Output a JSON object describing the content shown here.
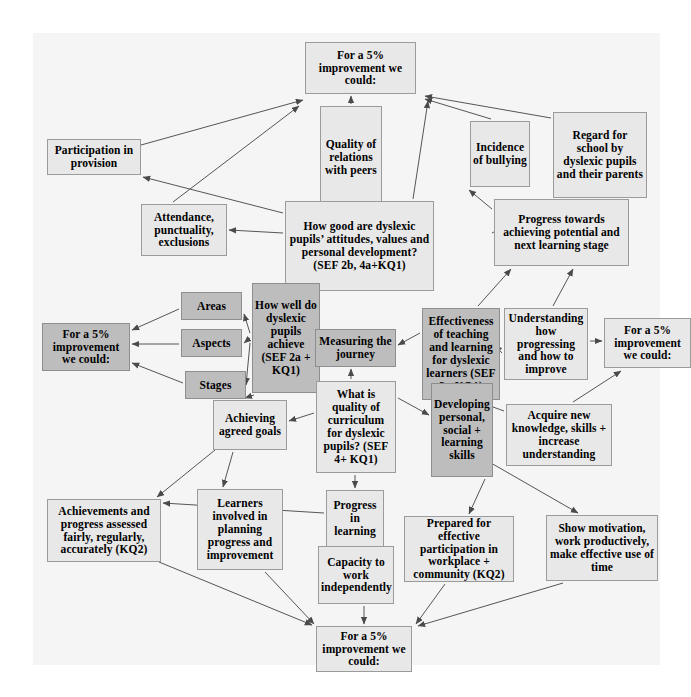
{
  "diagram": {
    "canvas": {
      "background": "#f5f5f5",
      "width": 627,
      "height": 632
    },
    "colors": {
      "node_light": "#e8e8e8",
      "node_dark": "#bdbdbd",
      "node_border": "#9b9b9b",
      "edge": "#555555",
      "text": "#000000"
    },
    "nodes": [
      {
        "id": "improve_top",
        "label": "For a 5% improvement we could:",
        "shade": "light",
        "x": 272,
        "y": 9,
        "w": 111,
        "h": 52,
        "fs": 11.5
      },
      {
        "id": "participation",
        "label": "Participation in provision",
        "shade": "light",
        "x": 14,
        "y": 106,
        "w": 94,
        "h": 36,
        "fs": 11.5
      },
      {
        "id": "quality_rel",
        "label": "Quality of relations with peers",
        "shade": "light",
        "x": 287,
        "y": 73,
        "w": 62,
        "h": 103,
        "fs": 11.5
      },
      {
        "id": "bullying",
        "label": "Incidence of bullying",
        "shade": "light",
        "x": 437,
        "y": 88,
        "w": 60,
        "h": 66,
        "fs": 11.5
      },
      {
        "id": "regard",
        "label": "Regard for school by dyslexic pupils and their parents",
        "shade": "light",
        "x": 520,
        "y": 79,
        "w": 94,
        "h": 86,
        "fs": 11.5
      },
      {
        "id": "attendance",
        "label": "Attendance, punctuality, exclusions",
        "shade": "light",
        "x": 108,
        "y": 171,
        "w": 86,
        "h": 52,
        "fs": 11.5
      },
      {
        "id": "attitudes",
        "label": "How good are dyslexic pupils’ attitudes, values and personal development? (SEF 2b, 4a+KQ1)",
        "shade": "light",
        "x": 252,
        "y": 168,
        "w": 149,
        "h": 90,
        "fs": 11.5
      },
      {
        "id": "progress_towards",
        "label": "Progress towards achieving potential and next learning stage",
        "shade": "light",
        "x": 461,
        "y": 166,
        "w": 135,
        "h": 67,
        "fs": 11.5
      },
      {
        "id": "areas",
        "label": "Areas",
        "shade": "dark",
        "x": 148,
        "y": 259,
        "w": 61,
        "h": 28,
        "fs": 11.5
      },
      {
        "id": "aspects",
        "label": "Aspects",
        "shade": "dark",
        "x": 148,
        "y": 296,
        "w": 61,
        "h": 28,
        "fs": 11.5
      },
      {
        "id": "stages",
        "label": "Stages",
        "shade": "dark",
        "x": 152,
        "y": 338,
        "w": 61,
        "h": 28,
        "fs": 11.5
      },
      {
        "id": "howwell",
        "label": "How well do dyslexic pupils achieve (SEF 2a + KQ1)",
        "shade": "dark",
        "x": 219,
        "y": 250,
        "w": 68,
        "h": 110,
        "fs": 11.5
      },
      {
        "id": "improve_left",
        "label": "For a 5% improvement we could:",
        "shade": "dark",
        "x": 9,
        "y": 290,
        "w": 88,
        "h": 48,
        "fs": 11.5
      },
      {
        "id": "measuring",
        "label": "Measuring the journey",
        "shade": "dark",
        "x": 282,
        "y": 296,
        "w": 81,
        "h": 38,
        "fs": 11.5
      },
      {
        "id": "effectiveness",
        "label": "Effectiveness of teaching and learning for dyslexic learners (SEF 3 +KQ1)",
        "shade": "dark",
        "x": 389,
        "y": 275,
        "w": 78,
        "h": 92,
        "fs": 11.5
      },
      {
        "id": "understanding",
        "label": "Understanding how progressing and how to improve",
        "shade": "light",
        "x": 471,
        "y": 275,
        "w": 84,
        "h": 72,
        "fs": 11.5
      },
      {
        "id": "improve_right",
        "label": "For a 5% improvement we could:",
        "shade": "light",
        "x": 571,
        "y": 285,
        "w": 87,
        "h": 50,
        "fs": 11.5
      },
      {
        "id": "curriculum",
        "label": "What is quality of curriculum for dyslexic pupils? (SEF 4+ KQ1)",
        "shade": "light",
        "x": 283,
        "y": 348,
        "w": 80,
        "h": 92,
        "fs": 11.5
      },
      {
        "id": "developing",
        "label": "Developing personal, social + learning skills",
        "shade": "dark",
        "x": 398,
        "y": 350,
        "w": 62,
        "h": 94,
        "fs": 11.5
      },
      {
        "id": "acquire",
        "label": "Acquire new knowledge, skills + increase understanding",
        "shade": "light",
        "x": 473,
        "y": 371,
        "w": 106,
        "h": 62,
        "fs": 11.5
      },
      {
        "id": "achieving",
        "label": "Achieving agreed goals",
        "shade": "light",
        "x": 180,
        "y": 367,
        "w": 74,
        "h": 50,
        "fs": 11.5
      },
      {
        "id": "achievements",
        "label": "Achievements and progress assessed fairly, regularly, accurately (KQ2)",
        "shade": "light",
        "x": 14,
        "y": 466,
        "w": 114,
        "h": 63,
        "fs": 11.5
      },
      {
        "id": "learners",
        "label": "Learners involved in planning progress and improvement",
        "shade": "light",
        "x": 164,
        "y": 456,
        "w": 86,
        "h": 81,
        "fs": 11.5
      },
      {
        "id": "progress_learn",
        "label": "Progress in learning",
        "shade": "light",
        "x": 293,
        "y": 457,
        "w": 58,
        "h": 57,
        "fs": 11.5
      },
      {
        "id": "capacity",
        "label": "Capacity to work independently",
        "shade": "light",
        "x": 285,
        "y": 513,
        "w": 76,
        "h": 58,
        "fs": 11.5
      },
      {
        "id": "prepared",
        "label": "Prepared for effective participation in workplace + community (KQ2)",
        "shade": "light",
        "x": 371,
        "y": 483,
        "w": 110,
        "h": 66,
        "fs": 11.5
      },
      {
        "id": "motivation",
        "label": "Show motivation, work productively, make effective use of time",
        "shade": "light",
        "x": 513,
        "y": 482,
        "w": 112,
        "h": 66,
        "fs": 11.5
      },
      {
        "id": "improve_bottom",
        "label": "For a 5% improvement we could:",
        "shade": "light",
        "x": 283,
        "y": 593,
        "w": 96,
        "h": 46,
        "fs": 11.5
      }
    ],
    "edges": [
      {
        "from": "participation",
        "to": "improve_top",
        "x1": 108,
        "y1": 112,
        "x2": 270,
        "y2": 67
      },
      {
        "from": "attendance",
        "to": "improve_top",
        "x1": 140,
        "y1": 169,
        "x2": 266,
        "y2": 73
      },
      {
        "from": "attitudes",
        "to": "participation",
        "x1": 250,
        "y1": 180,
        "x2": 110,
        "y2": 144
      },
      {
        "from": "attitudes",
        "to": "attendance",
        "x1": 250,
        "y1": 200,
        "x2": 196,
        "y2": 197
      },
      {
        "from": "quality_rel",
        "to": "improve_top",
        "x1": 318,
        "y1": 71,
        "x2": 318,
        "y2": 63
      },
      {
        "from": "attitudes",
        "to": "quality_rel",
        "x1": 318,
        "y1": 166,
        "x2": 318,
        "y2": 178
      },
      {
        "from": "attitudes",
        "to": "improve_top",
        "x1": 380,
        "y1": 166,
        "x2": 395,
        "y2": 68
      },
      {
        "from": "bullying",
        "to": "improve_top",
        "x1": 458,
        "y1": 86,
        "x2": 392,
        "y2": 66
      },
      {
        "from": "regard",
        "to": "improve_top",
        "x1": 518,
        "y1": 85,
        "x2": 392,
        "y2": 63
      },
      {
        "from": "progress_towards",
        "to": "bullying",
        "x1": 459,
        "y1": 176,
        "x2": 436,
        "y2": 157
      },
      {
        "from": "progress_towards",
        "to": "regard",
        "x1": 459,
        "y1": 200,
        "x2": 518,
        "y2": 168
      },
      {
        "from": "areas",
        "to": "improve_left",
        "x1": 146,
        "y1": 276,
        "x2": 99,
        "y2": 297
      },
      {
        "from": "aspects",
        "to": "improve_left",
        "x1": 146,
        "y1": 311,
        "x2": 99,
        "y2": 311
      },
      {
        "from": "stages",
        "to": "improve_left",
        "x1": 150,
        "y1": 350,
        "x2": 99,
        "y2": 330
      },
      {
        "from": "howwell",
        "to": "areas",
        "x1": 217,
        "y1": 300,
        "x2": 211,
        "y2": 281
      },
      {
        "from": "howwell",
        "to": "aspects",
        "x1": 217,
        "y1": 305,
        "x2": 211,
        "y2": 310
      },
      {
        "from": "howwell",
        "to": "stages",
        "x1": 217,
        "y1": 310,
        "x2": 213,
        "y2": 352
      },
      {
        "from": "measuring",
        "to": "howwell",
        "x1": 280,
        "y1": 315,
        "x2": 289,
        "y2": 315
      },
      {
        "from": "curriculum",
        "to": "measuring",
        "x1": 318,
        "y1": 346,
        "x2": 318,
        "y2": 336
      },
      {
        "from": "effectiveness",
        "to": "progress_towards",
        "x1": 445,
        "y1": 273,
        "x2": 478,
        "y2": 236
      },
      {
        "from": "effectiveness",
        "to": "measuring",
        "x1": 387,
        "y1": 300,
        "x2": 365,
        "y2": 312
      },
      {
        "from": "understanding",
        "to": "progress_towards",
        "x1": 520,
        "y1": 273,
        "x2": 540,
        "y2": 236
      },
      {
        "from": "understanding",
        "to": "improve_right",
        "x1": 557,
        "y1": 308,
        "x2": 569,
        "y2": 308
      },
      {
        "from": "understanding",
        "to": "effectiveness",
        "x1": 469,
        "y1": 320,
        "x2": 462,
        "y2": 312
      },
      {
        "from": "acquire",
        "to": "improve_right",
        "x1": 540,
        "y1": 369,
        "x2": 588,
        "y2": 338
      },
      {
        "from": "acquire",
        "to": "effectiveness",
        "x1": 471,
        "y1": 378,
        "x2": 449,
        "y2": 370
      },
      {
        "from": "developing",
        "to": "effectiveness",
        "x1": 424,
        "y1": 348,
        "x2": 424,
        "y2": 369
      },
      {
        "from": "curriculum",
        "to": "developing",
        "x1": 365,
        "y1": 365,
        "x2": 396,
        "y2": 382
      },
      {
        "from": "curriculum",
        "to": "achieving",
        "x1": 281,
        "y1": 380,
        "x2": 256,
        "y2": 388
      },
      {
        "from": "howwell",
        "to": "achieving",
        "x1": 221,
        "y1": 362,
        "x2": 212,
        "y2": 365
      },
      {
        "from": "achieving",
        "to": "learners",
        "x1": 200,
        "y1": 419,
        "x2": 190,
        "y2": 454
      },
      {
        "from": "achieving",
        "to": "achievements",
        "x1": 182,
        "y1": 417,
        "x2": 124,
        "y2": 464
      },
      {
        "from": "curriculum",
        "to": "progress_learn",
        "x1": 322,
        "y1": 442,
        "x2": 322,
        "y2": 455
      },
      {
        "from": "progress_learn",
        "to": "capacity",
        "x1": 322,
        "y1": 516,
        "x2": 322,
        "y2": 511
      },
      {
        "from": "progress_learn",
        "to": "achievements",
        "x1": 291,
        "y1": 480,
        "x2": 130,
        "y2": 470
      },
      {
        "from": "developing",
        "to": "prepared",
        "x1": 452,
        "y1": 446,
        "x2": 436,
        "y2": 481
      },
      {
        "from": "developing",
        "to": "motivation",
        "x1": 458,
        "y1": 430,
        "x2": 545,
        "y2": 480
      },
      {
        "from": "capacity",
        "to": "improve_bottom",
        "x1": 331,
        "y1": 573,
        "x2": 331,
        "y2": 591
      },
      {
        "from": "learners",
        "to": "improve_bottom",
        "x1": 232,
        "y1": 539,
        "x2": 281,
        "y2": 591
      },
      {
        "from": "achievements",
        "to": "improve_bottom",
        "x1": 126,
        "y1": 529,
        "x2": 279,
        "y2": 592
      },
      {
        "from": "prepared",
        "to": "improve_bottom",
        "x1": 412,
        "y1": 551,
        "x2": 383,
        "y2": 591
      },
      {
        "from": "motivation",
        "to": "improve_bottom",
        "x1": 530,
        "y1": 550,
        "x2": 385,
        "y2": 593
      }
    ]
  }
}
